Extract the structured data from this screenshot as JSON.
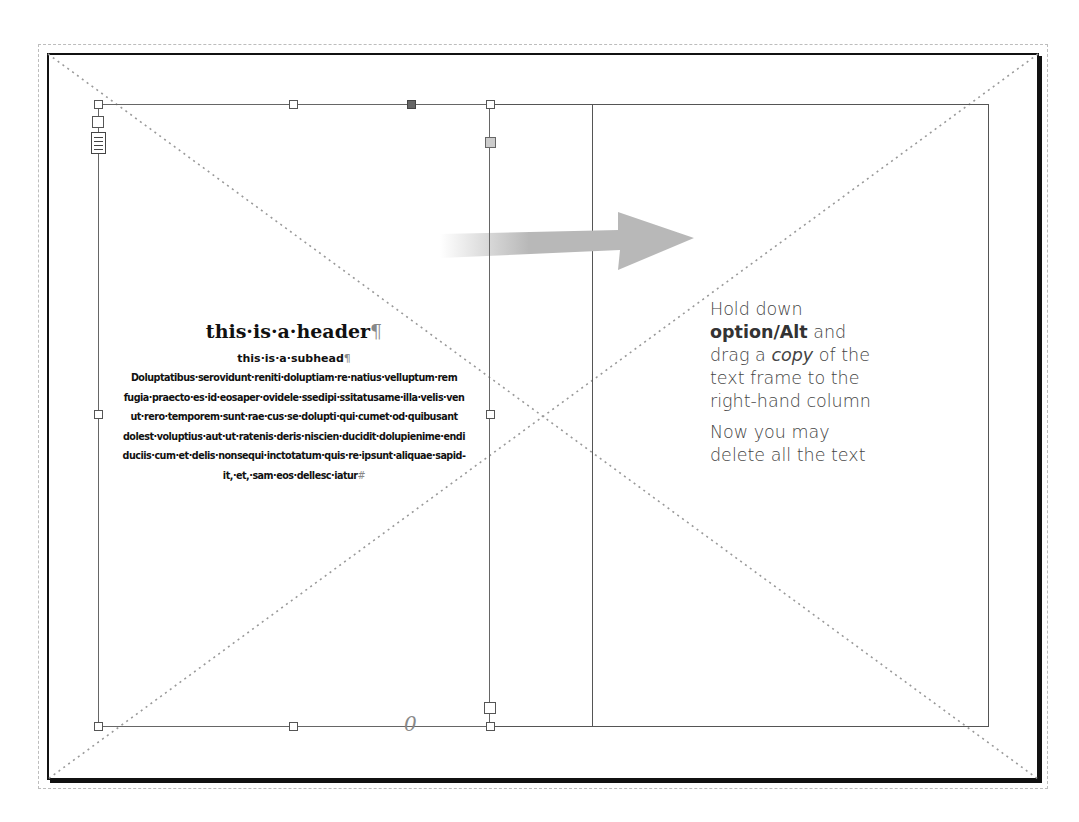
{
  "document": {
    "header": "this·is·a·header",
    "subhead": "this·is·a·subhead",
    "body_lines": [
      "Doluptatibus·serovidunt·reniti·doluptiam·re·natius·velluptum·rem",
      "fugia·praecto·es·id·eosaper·ovidele·ssedipi·ssitatusame·illa·velis·ven",
      "ut·rero·temporem·sunt·rae·cus·se·dolupti·qui·cumet·od·quibusant",
      "dolest·voluptius·aut·ut·ratenis·deris·niscien·ducidit·dolupienime·endi",
      "duciis·cum·et·delis·nonsequi·inctotatum·quis·re·ipsunt·aliquae·sapid-",
      "it,·et,·sam·eos·dellesc·iatur"
    ],
    "pilcrow": "¶",
    "end_marker": "#"
  },
  "instructions": {
    "line1": "Hold down",
    "key": "option/Alt",
    "line2_rest": " and",
    "line3_pre": "drag a ",
    "line3_em": "copy",
    "line3_post": " of the",
    "line4": "text frame to the",
    "line5": "right-hand column",
    "para2_line1": "Now you may",
    "para2_line2": "delete all the text"
  },
  "frame": {
    "out_port_glyph": "0"
  },
  "colors": {
    "arrow": "#b8b8b8",
    "guide": "#555555",
    "page_border": "#111111"
  }
}
